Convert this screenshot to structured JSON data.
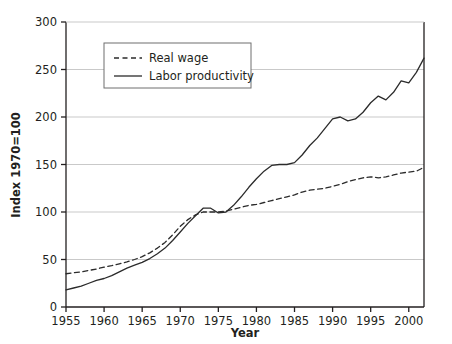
{
  "chart_data": {
    "type": "line",
    "title": "",
    "xlabel": "Year",
    "ylabel": "Index 1970=100",
    "xlim": [
      1955,
      2002
    ],
    "ylim": [
      0,
      300
    ],
    "xticks": [
      1955,
      1960,
      1965,
      1970,
      1975,
      1980,
      1985,
      1990,
      1995,
      2000
    ],
    "xtick_labels": [
      "1955",
      "1960",
      "1965",
      "1970",
      "1975",
      "1980",
      "1985",
      "1990",
      "1995",
      "2000"
    ],
    "yticks": [
      0,
      50,
      100,
      150,
      200,
      250,
      300
    ],
    "ytick_labels": [
      "0",
      "50",
      "100",
      "150",
      "200",
      "250",
      "300"
    ],
    "grid": "horizontal",
    "legend_position": "upper-left-inside",
    "x": [
      1955,
      1956,
      1957,
      1958,
      1959,
      1960,
      1961,
      1962,
      1963,
      1964,
      1965,
      1966,
      1967,
      1968,
      1969,
      1970,
      1971,
      1972,
      1973,
      1974,
      1975,
      1976,
      1977,
      1978,
      1979,
      1980,
      1981,
      1982,
      1983,
      1984,
      1985,
      1986,
      1987,
      1988,
      1989,
      1990,
      1991,
      1992,
      1993,
      1994,
      1995,
      1996,
      1997,
      1998,
      1999,
      2000,
      2001,
      2002
    ],
    "series": [
      {
        "name": "Real wage",
        "style": "dashed",
        "color": "#2b2b2b",
        "values": [
          35,
          36,
          37,
          38.5,
          40,
          42,
          43.5,
          45.5,
          47.5,
          50,
          53,
          57,
          62,
          68,
          76,
          85,
          92,
          97,
          100,
          100,
          100,
          101,
          103,
          105,
          107,
          108,
          110,
          112,
          114,
          116,
          118,
          121,
          123,
          124,
          125,
          127,
          129,
          132,
          134,
          136,
          137,
          136,
          137,
          139,
          141,
          142,
          143,
          147
        ]
      },
      {
        "name": "Labor productivity",
        "style": "solid",
        "color": "#2b2b2b",
        "values": [
          18,
          20,
          22,
          25,
          28,
          30,
          33,
          37,
          41,
          44,
          47,
          51,
          56,
          62,
          70,
          79,
          88,
          96,
          104,
          104,
          99,
          100,
          107,
          116,
          126,
          135,
          143,
          149,
          150,
          150,
          152,
          160,
          170,
          178,
          188,
          198,
          200,
          196,
          198,
          205,
          215,
          222,
          218,
          226,
          238,
          236,
          247,
          262
        ]
      }
    ],
    "annotations": []
  },
  "legend": {
    "items": [
      {
        "label": "Real wage",
        "style": "dashed"
      },
      {
        "label": "Labor productivity",
        "style": "solid"
      }
    ]
  },
  "colors": {
    "axis": "#231f20",
    "grid": "#c9c9c9",
    "line": "#2b2b2b",
    "background": "#ffffff",
    "legend_border": "#6f6f6f"
  }
}
